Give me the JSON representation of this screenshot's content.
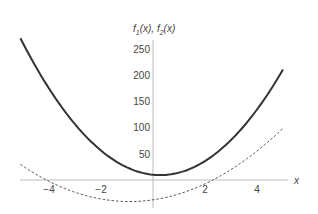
{
  "chart_data": {
    "type": "line",
    "title": "",
    "xlabel": "x",
    "ylabel": "f1(x), f2(x)",
    "xlim": [
      -5.2,
      5.2
    ],
    "ylim": [
      -40,
      265
    ],
    "x_ticks": [
      -4,
      -2,
      2,
      4
    ],
    "y_ticks": [
      50,
      100,
      150,
      200,
      250
    ],
    "grid": false,
    "series": [
      {
        "name": "f1(x)",
        "style": "solid",
        "formula": "9x^2 - 5x + 10",
        "x": [
          -5,
          -4,
          -3,
          -2,
          -1,
          0,
          1,
          2,
          3,
          4,
          5
        ],
        "values": [
          260,
          174,
          106,
          56,
          24,
          10,
          14,
          36,
          76,
          134,
          210
        ]
      },
      {
        "name": "f2(x)",
        "style": "dashed",
        "formula": "4(x+4.1)(x-2.3)",
        "x": [
          -5,
          -4,
          -3,
          -2,
          -1,
          0,
          1,
          2,
          3,
          4,
          5
        ],
        "values": [
          26,
          -3,
          -23,
          -34,
          -34,
          -38,
          -29,
          -10,
          20,
          52,
          98
        ]
      }
    ]
  }
}
